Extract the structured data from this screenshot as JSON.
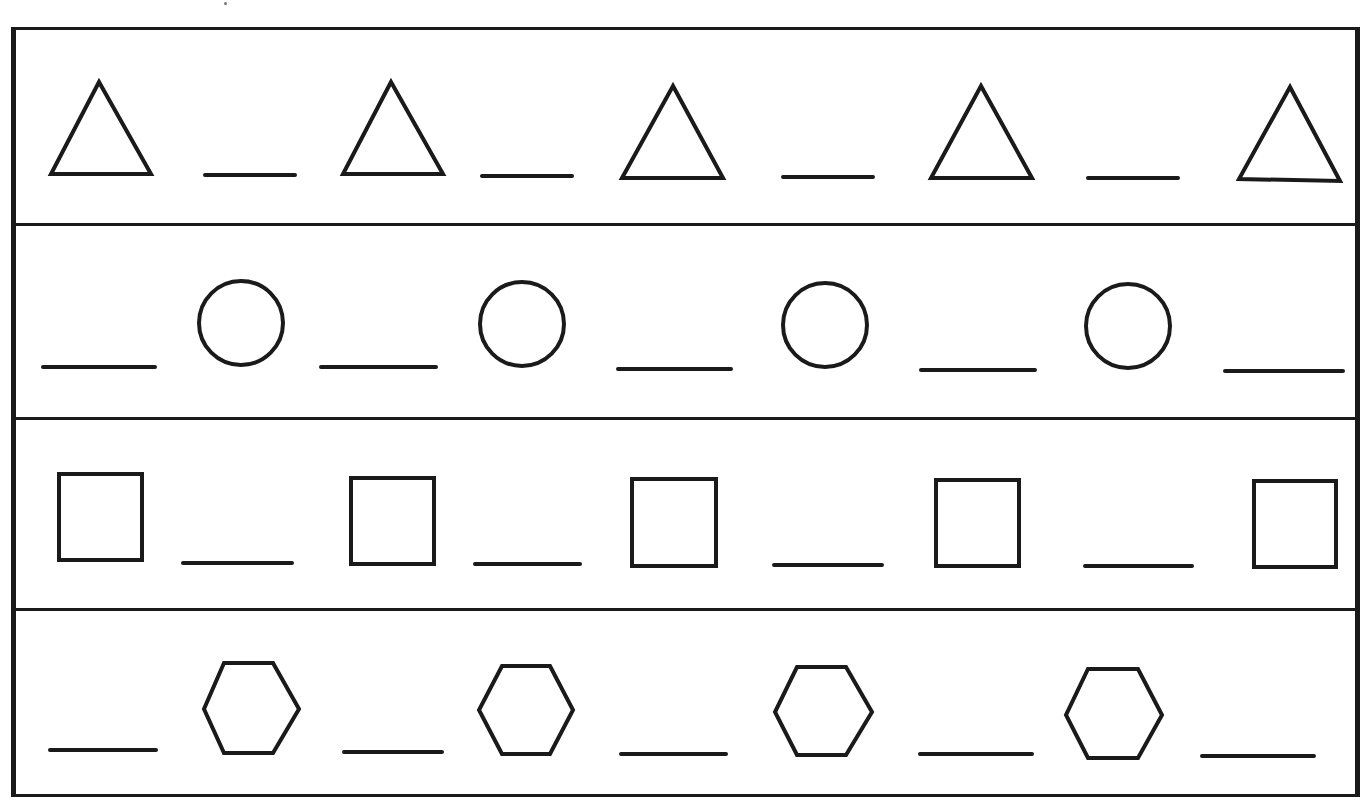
{
  "worksheet": {
    "title": "",
    "rows": [
      {
        "name": "triangle-pattern",
        "shape": "triangle",
        "sequence": [
          "triangle",
          "blank",
          "triangle",
          "blank",
          "triangle",
          "blank",
          "triangle",
          "blank",
          "triangle"
        ]
      },
      {
        "name": "circle-pattern",
        "shape": "circle",
        "sequence": [
          "blank",
          "circle",
          "blank",
          "circle",
          "blank",
          "circle",
          "blank",
          "circle",
          "blank"
        ]
      },
      {
        "name": "square-pattern",
        "shape": "square",
        "sequence": [
          "square",
          "blank",
          "square",
          "blank",
          "square",
          "blank",
          "square",
          "blank",
          "square"
        ]
      },
      {
        "name": "hexagon-pattern",
        "shape": "hexagon",
        "sequence": [
          "blank",
          "hexagon",
          "blank",
          "hexagon",
          "blank",
          "hexagon",
          "blank",
          "hexagon",
          "blank"
        ]
      }
    ],
    "colors": {
      "ink": "#1a1a1a",
      "paper": "#ffffff"
    }
  }
}
